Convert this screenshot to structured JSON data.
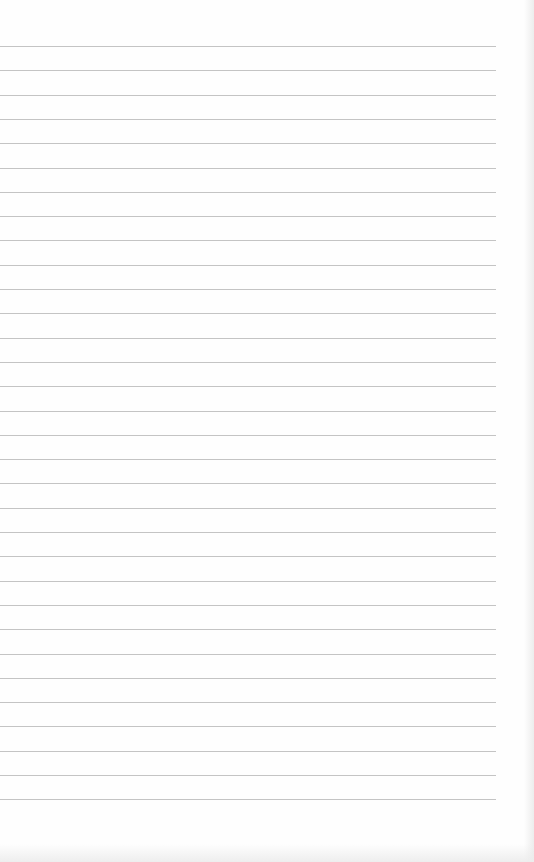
{
  "paper": {
    "type": "lined-paper",
    "background_color": "#fefefe",
    "line_color": "#c4c4c4",
    "line_count": 32,
    "first_line_y": 46,
    "line_spacing": 24.3,
    "line_left": 0,
    "line_right": 496,
    "content_text": ""
  }
}
